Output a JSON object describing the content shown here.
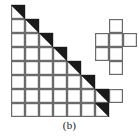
{
  "figure": {
    "caption": "(b)",
    "label": "b",
    "colors": {
      "grid_line": "#6b6b6b",
      "outline_line": "#6b6b6b",
      "fill_black": "#1a1a1a",
      "background": "#ffffff"
    },
    "geometry": {
      "origin_x": 11,
      "origin_y": 5,
      "cell_size": 14,
      "columns": 7,
      "rows": 8,
      "stroke_width": 1.2
    },
    "chart_data": {
      "type": "grid",
      "title": "(b)",
      "grid_cells": [
        {
          "col": 0,
          "row": 0,
          "state": "triangle"
        },
        {
          "col": 0,
          "row": 1,
          "state": "empty"
        },
        {
          "col": 1,
          "row": 1,
          "state": "triangle"
        },
        {
          "col": 0,
          "row": 2,
          "state": "empty"
        },
        {
          "col": 1,
          "row": 2,
          "state": "empty"
        },
        {
          "col": 2,
          "row": 2,
          "state": "triangle"
        },
        {
          "col": 0,
          "row": 3,
          "state": "empty"
        },
        {
          "col": 1,
          "row": 3,
          "state": "empty"
        },
        {
          "col": 2,
          "row": 3,
          "state": "empty"
        },
        {
          "col": 3,
          "row": 3,
          "state": "triangle"
        },
        {
          "col": 0,
          "row": 4,
          "state": "empty"
        },
        {
          "col": 1,
          "row": 4,
          "state": "empty"
        },
        {
          "col": 2,
          "row": 4,
          "state": "empty"
        },
        {
          "col": 3,
          "row": 4,
          "state": "empty"
        },
        {
          "col": 4,
          "row": 4,
          "state": "triangle"
        },
        {
          "col": 0,
          "row": 5,
          "state": "empty"
        },
        {
          "col": 1,
          "row": 5,
          "state": "empty"
        },
        {
          "col": 2,
          "row": 5,
          "state": "empty"
        },
        {
          "col": 3,
          "row": 5,
          "state": "empty"
        },
        {
          "col": 4,
          "row": 5,
          "state": "empty"
        },
        {
          "col": 5,
          "row": 5,
          "state": "triangle"
        },
        {
          "col": 0,
          "row": 6,
          "state": "empty"
        },
        {
          "col": 1,
          "row": 6,
          "state": "empty"
        },
        {
          "col": 2,
          "row": 6,
          "state": "empty"
        },
        {
          "col": 3,
          "row": 6,
          "state": "empty"
        },
        {
          "col": 4,
          "row": 6,
          "state": "empty"
        },
        {
          "col": 5,
          "row": 6,
          "state": "empty"
        },
        {
          "col": 6,
          "row": 6,
          "state": "triangle"
        },
        {
          "col": 0,
          "row": 7,
          "state": "empty"
        },
        {
          "col": 1,
          "row": 7,
          "state": "empty"
        },
        {
          "col": 2,
          "row": 7,
          "state": "empty"
        },
        {
          "col": 3,
          "row": 7,
          "state": "empty"
        },
        {
          "col": 4,
          "row": 7,
          "state": "empty"
        },
        {
          "col": 5,
          "row": 7,
          "state": "empty"
        },
        {
          "col": 6,
          "row": 7,
          "state": "triangle"
        }
      ],
      "detached_cells": [
        {
          "col": 7,
          "row": 1,
          "state": "outline"
        },
        {
          "col": 6,
          "row": 2,
          "state": "outline"
        },
        {
          "col": 7,
          "row": 2,
          "state": "outline"
        },
        {
          "col": 8,
          "row": 2,
          "state": "outline"
        },
        {
          "col": 6,
          "row": 3,
          "state": "outline"
        },
        {
          "col": 7,
          "row": 3,
          "state": "outline"
        },
        {
          "col": 7,
          "row": 4,
          "state": "outline"
        },
        {
          "col": 7,
          "row": 6,
          "state": "outline"
        }
      ],
      "shaded_count": 8,
      "outlined_count": 8
    }
  }
}
